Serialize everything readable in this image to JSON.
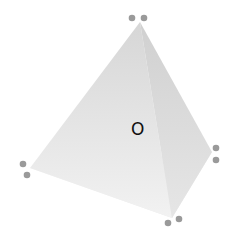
{
  "diagram": {
    "type": "tetrahedron",
    "center_label": "O",
    "vertices": {
      "apex": [
        140,
        22
      ],
      "left": [
        30,
        168
      ],
      "right": [
        212,
        152
      ],
      "front": [
        172,
        218
      ]
    },
    "vertex_markers": [
      {
        "name": "apex",
        "dots": [
          [
            132,
            18
          ],
          [
            144,
            18
          ]
        ]
      },
      {
        "name": "left",
        "dots": [
          [
            23,
            164
          ],
          [
            27,
            175
          ]
        ]
      },
      {
        "name": "right",
        "dots": [
          [
            216,
            148
          ],
          [
            216,
            160
          ]
        ]
      },
      {
        "name": "front",
        "dots": [
          [
            168,
            223
          ],
          [
            179,
            219
          ]
        ]
      }
    ],
    "colors": {
      "face_left": "#e4e4e4",
      "face_right": "#d8d8d8",
      "face_bottom": "#eeeeee",
      "dot": "#9a9a9a",
      "label": "#111111"
    }
  }
}
